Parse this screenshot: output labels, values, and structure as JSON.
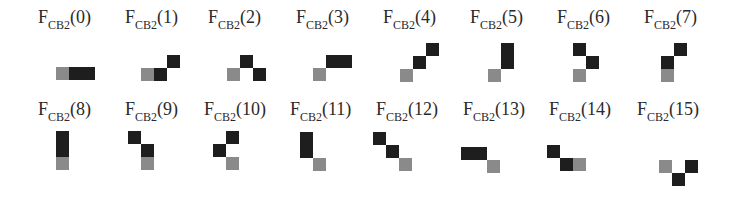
{
  "colors": {
    "dark": "#1e1e1e",
    "gray": "#8a8a8a",
    "background": "#ffffff"
  },
  "cell_size": 13,
  "figures": [
    {
      "id": 0,
      "main": "F",
      "sub": "CB2",
      "arg": "(0)",
      "label_x": 38,
      "label_y": 8,
      "ox": 56,
      "oy": 41,
      "cells": [
        [
          "gray",
          0,
          2
        ],
        [
          "dark",
          1,
          2
        ],
        [
          "dark",
          2,
          2
        ]
      ]
    },
    {
      "id": 1,
      "main": "F",
      "sub": "CB2",
      "arg": "(1)",
      "label_x": 125,
      "label_y": 8,
      "ox": 141,
      "oy": 42,
      "cells": [
        [
          "gray",
          0,
          2
        ],
        [
          "dark",
          1,
          2
        ],
        [
          "dark",
          2,
          1
        ]
      ]
    },
    {
      "id": 2,
      "main": "F",
      "sub": "CB2",
      "arg": "(2)",
      "label_x": 208,
      "label_y": 8,
      "ox": 227,
      "oy": 42,
      "cells": [
        [
          "gray",
          0,
          2
        ],
        [
          "dark",
          1,
          1
        ],
        [
          "dark",
          2,
          2
        ]
      ]
    },
    {
      "id": 3,
      "main": "F",
      "sub": "CB2",
      "arg": "(3)",
      "label_x": 296,
      "label_y": 8,
      "ox": 313,
      "oy": 42,
      "cells": [
        [
          "gray",
          0,
          2
        ],
        [
          "dark",
          1,
          1
        ],
        [
          "dark",
          2,
          1
        ]
      ]
    },
    {
      "id": 4,
      "main": "F",
      "sub": "CB2",
      "arg": "(4)",
      "label_x": 383,
      "label_y": 8,
      "ox": 400,
      "oy": 43,
      "cells": [
        [
          "gray",
          0,
          2
        ],
        [
          "dark",
          1,
          1
        ],
        [
          "dark",
          2,
          0
        ]
      ]
    },
    {
      "id": 5,
      "main": "F",
      "sub": "CB2",
      "arg": "(5)",
      "label_x": 470,
      "label_y": 8,
      "ox": 488,
      "oy": 43,
      "cells": [
        [
          "gray",
          0,
          2
        ],
        [
          "dark",
          1,
          1
        ],
        [
          "dark",
          1,
          0
        ]
      ]
    },
    {
      "id": 6,
      "main": "F",
      "sub": "CB2",
      "arg": "(6)",
      "label_x": 557,
      "label_y": 8,
      "ox": 573,
      "oy": 43,
      "cells": [
        [
          "gray",
          0,
          2
        ],
        [
          "dark",
          1,
          1
        ],
        [
          "dark",
          0,
          0
        ]
      ]
    },
    {
      "id": 7,
      "main": "F",
      "sub": "CB2",
      "arg": "(7)",
      "label_x": 644,
      "label_y": 8,
      "ox": 661,
      "oy": 43,
      "cells": [
        [
          "gray",
          0,
          2
        ],
        [
          "dark",
          0,
          1
        ],
        [
          "dark",
          1,
          0
        ]
      ]
    },
    {
      "id": 8,
      "main": "F",
      "sub": "CB2",
      "arg": "(8)",
      "label_x": 38,
      "label_y": 100,
      "ox": 56,
      "oy": 131,
      "cells": [
        [
          "gray",
          0,
          2
        ],
        [
          "dark",
          0,
          1
        ],
        [
          "dark",
          0,
          0
        ]
      ]
    },
    {
      "id": 9,
      "main": "F",
      "sub": "CB2",
      "arg": "(9)",
      "label_x": 125,
      "label_y": 100,
      "ox": 128,
      "oy": 131,
      "cells": [
        [
          "gray",
          1,
          2
        ],
        [
          "dark",
          1,
          1
        ],
        [
          "dark",
          0,
          0
        ]
      ]
    },
    {
      "id": 10,
      "main": "F",
      "sub": "CB2",
      "arg": "(10)",
      "label_x": 204,
      "label_y": 100,
      "ox": 213,
      "oy": 131,
      "cells": [
        [
          "gray",
          1,
          2
        ],
        [
          "dark",
          0,
          1
        ],
        [
          "dark",
          1,
          0
        ]
      ]
    },
    {
      "id": 11,
      "main": "F",
      "sub": "CB2",
      "arg": "(11)",
      "label_x": 290,
      "label_y": 100,
      "ox": 300,
      "oy": 132,
      "cells": [
        [
          "gray",
          1,
          2
        ],
        [
          "dark",
          0,
          1
        ],
        [
          "dark",
          0,
          0
        ]
      ]
    },
    {
      "id": 12,
      "main": "F",
      "sub": "CB2",
      "arg": "(12)",
      "label_x": 376,
      "label_y": 100,
      "ox": 373,
      "oy": 132,
      "cells": [
        [
          "gray",
          2,
          2
        ],
        [
          "dark",
          1,
          1
        ],
        [
          "dark",
          0,
          0
        ]
      ]
    },
    {
      "id": 13,
      "main": "F",
      "sub": "CB2",
      "arg": "(13)",
      "label_x": 463,
      "label_y": 100,
      "ox": 461,
      "oy": 134,
      "cells": [
        [
          "gray",
          2,
          2
        ],
        [
          "dark",
          1,
          1
        ],
        [
          "dark",
          0,
          1
        ]
      ]
    },
    {
      "id": 14,
      "main": "F",
      "sub": "CB2",
      "arg": "(14)",
      "label_x": 549,
      "label_y": 100,
      "ox": 547,
      "oy": 145,
      "cells": [
        [
          "dark",
          0,
          0
        ],
        [
          "dark",
          1,
          1
        ],
        [
          "gray",
          2,
          1
        ]
      ]
    },
    {
      "id": 15,
      "main": "F",
      "sub": "CB2",
      "arg": "(15)",
      "label_x": 637,
      "label_y": 100,
      "ox": 659,
      "oy": 147,
      "cells": [
        [
          "gray",
          0,
          1
        ],
        [
          "dark",
          2,
          1
        ],
        [
          "dark",
          1,
          2
        ]
      ]
    }
  ]
}
